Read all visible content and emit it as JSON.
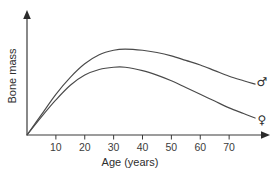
{
  "chart_data": {
    "type": "line",
    "title": "",
    "xlabel": "Age (years)",
    "ylabel": "Bone mass",
    "xlim": [
      0,
      80
    ],
    "ylim": [
      0,
      100
    ],
    "grid": false,
    "legend_position": "right-inline",
    "xticks": [
      10,
      20,
      30,
      40,
      50,
      60,
      70
    ],
    "xticklabels": [
      "10",
      "20",
      "30",
      "40",
      "50",
      "60",
      "70"
    ],
    "yticks": [],
    "yticklabels": [],
    "annotations": [
      {
        "name": "male-symbol",
        "text": "♂",
        "x": 80,
        "y": 47
      },
      {
        "name": "female-symbol",
        "text": "♀",
        "x": 80,
        "y": 13
      }
    ],
    "series": [
      {
        "name": "male",
        "symbol": "♂",
        "color": "#4a4a4a",
        "x": [
          0,
          5,
          10,
          15,
          20,
          25,
          30,
          34,
          40,
          45,
          50,
          55,
          60,
          65,
          70,
          75,
          79
        ],
        "values": [
          0,
          18,
          36,
          51,
          63,
          71,
          75,
          76,
          75,
          73,
          70,
          66,
          62,
          57,
          52,
          48,
          45
        ]
      },
      {
        "name": "female",
        "symbol": "♀",
        "color": "#4a4a4a",
        "x": [
          0,
          5,
          10,
          15,
          20,
          25,
          30,
          34,
          40,
          45,
          50,
          55,
          60,
          65,
          70,
          75,
          79
        ],
        "values": [
          0,
          16,
          31,
          44,
          53,
          58,
          60,
          60,
          57,
          53,
          48,
          42,
          36,
          30,
          24,
          19,
          15
        ]
      }
    ]
  },
  "axes": {
    "x_axis_name": "x-axis",
    "y_axis_name": "y-axis"
  }
}
